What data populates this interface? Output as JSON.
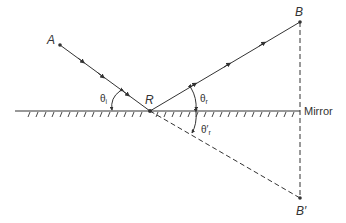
{
  "diagram": {
    "points": {
      "A": {
        "label": "A",
        "x": 60,
        "y": 45
      },
      "R": {
        "label": "R",
        "x": 150,
        "y": 111
      },
      "B": {
        "label": "B",
        "x": 300,
        "y": 22
      },
      "B_prime": {
        "label": "B′",
        "x": 300,
        "y": 198
      }
    },
    "mirror": {
      "label": "Mirror",
      "y": 111,
      "x_start": 15,
      "x_end": 300
    },
    "angles": {
      "incidence": {
        "symbol": "θ",
        "subscript": "i"
      },
      "reflection": {
        "symbol": "θ",
        "subscript": "r"
      },
      "image": {
        "symbol": "θ′",
        "subscript": "r"
      }
    },
    "colors": {
      "line": "#333333",
      "background": "#ffffff"
    }
  }
}
